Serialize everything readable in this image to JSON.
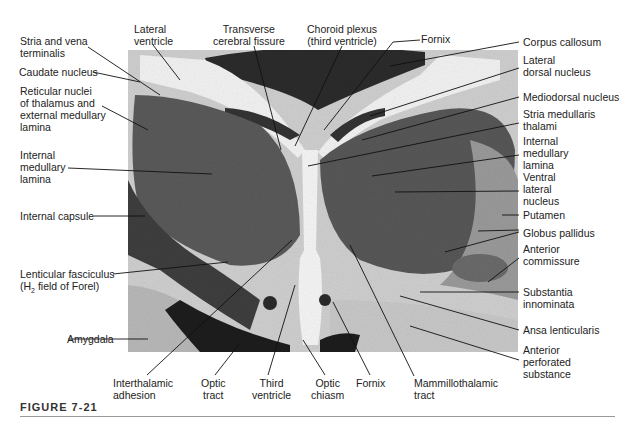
{
  "figure": {
    "caption": "FIGURE 7-21"
  },
  "labels": {
    "stria_vena": "Stria and vena\nterminalis",
    "lateral_ventricle": "Lateral\nventricle",
    "transverse_fissure": "Transverse\ncerebral fissure",
    "choroid_plexus": "Choroid plexus\n(third ventricle)",
    "fornix_top": "Fornix",
    "corpus_callosum": "Corpus callosum",
    "lateral_dorsal": "Lateral\ndorsal nucleus",
    "caudate": "Caudate nucleus",
    "reticular": "Reticular nuclei\nof thalamus and\nexternal medullary\nlamina",
    "mediodorsal": "Mediodorsal nucleus",
    "stria_medullaris": "Stria medullaris\nthalami",
    "int_med_lamina_left": "Internal\nmedullary\nlamina",
    "int_med_lamina_right": "Internal\nmedullary\nlamina",
    "ventral_lateral": "Ventral\nlateral\nnucleus",
    "internal_capsule": "Internal capsule",
    "putamen": "Putamen",
    "globus_pallidus": "Globus pallidus",
    "anterior_commissure": "Anterior\ncommissure",
    "lenticular_fasciculus_1": "Lenticular fasciculus",
    "lenticular_fasciculus_2": "(H",
    "lenticular_fasciculus_sub": "2",
    "lenticular_fasciculus_3": " field of Forel)",
    "substantia_innominata": "Substantia\ninnominata",
    "amygdala": "Amygdala",
    "ansa_lenticularis": "Ansa lenticularis",
    "anterior_perforated": "Anterior\nperforated\nsubstance",
    "interthalamic": "Interthalamic\nadhesion",
    "optic_tract": "Optic\ntract",
    "third_ventricle": "Third\nventricle",
    "optic_chiasm": "Optic\nchiasm",
    "fornix_bottom": "Fornix",
    "mammillothalamic": "Mammillothalamic\ntract"
  }
}
